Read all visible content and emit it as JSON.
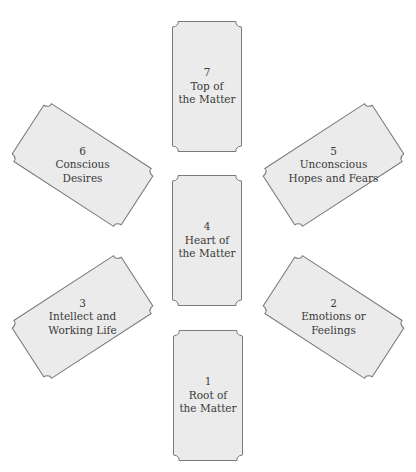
{
  "diagram": {
    "type": "tarot-spread",
    "colors": {
      "card_fill": "#ebebeb",
      "card_border": "#7a7a7a",
      "text": "#3a3a3a",
      "background": "#ffffff"
    },
    "cards": [
      {
        "number": "1",
        "line1": "Root of",
        "line2": "the Matter"
      },
      {
        "number": "2",
        "line1": "Emotions or",
        "line2": "Feelings"
      },
      {
        "number": "3",
        "line1": "Intellect and",
        "line2": "Working Life"
      },
      {
        "number": "4",
        "line1": "Heart of",
        "line2": "the Matter"
      },
      {
        "number": "5",
        "line1": "Unconscious",
        "line2": "Hopes and Fears"
      },
      {
        "number": "6",
        "line1": "Conscious",
        "line2": "Desires"
      },
      {
        "number": "7",
        "line1": "Top of",
        "line2": "the Matter"
      }
    ]
  }
}
